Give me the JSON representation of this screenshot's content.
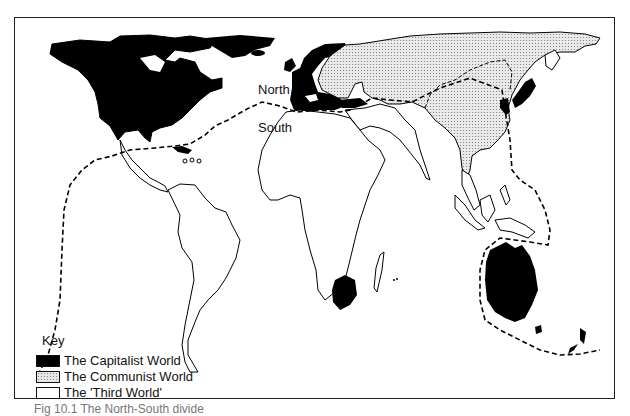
{
  "map": {
    "labels": {
      "north": "North",
      "south": "South"
    },
    "divide_line": "North-South dividing line (dashed)"
  },
  "key": {
    "title": "Key",
    "items": [
      {
        "label": "The Capitalist World",
        "swatch": "solid-black",
        "color": "#000000"
      },
      {
        "label": "The Communist World",
        "swatch": "stippled-grey",
        "color": "#e6e6e6"
      },
      {
        "label": "The 'Third World'",
        "swatch": "white",
        "color": "#ffffff"
      }
    ]
  },
  "caption": "Fig 10.1   The North-South divide"
}
